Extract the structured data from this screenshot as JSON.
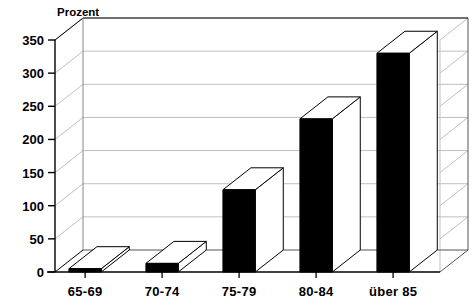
{
  "chart_data": {
    "type": "bar",
    "title": "",
    "subtitle": "",
    "ylabel": "Prozent",
    "xlabel": "",
    "categories": [
      "65-69",
      "70-74",
      "75-79",
      "80-84",
      "über 85"
    ],
    "values": [
      5,
      13,
      124,
      231,
      330
    ],
    "series": [
      {
        "name": "Prozent",
        "values": [
          5,
          13,
          124,
          231,
          330
        ]
      }
    ],
    "ylim": [
      0,
      350
    ],
    "yticks": [
      0,
      50,
      100,
      150,
      200,
      250,
      300,
      350
    ],
    "ytick_labels": [
      "0",
      "50",
      "100",
      "150",
      "200",
      "250",
      "300",
      "350"
    ],
    "grid": true,
    "grid_axis": "y",
    "legend": false,
    "legend_position": "none",
    "style": "3d-bar",
    "colors": {
      "bar_front": "#000000",
      "bar_top": "#ffffff",
      "bar_side": "#ffffff",
      "bar_edge": "#000000",
      "grid": "#bfbfbf",
      "axis": "#000000",
      "background": "#ffffff",
      "text": "#000000"
    }
  },
  "axis": {
    "y_title": "Prozent"
  }
}
